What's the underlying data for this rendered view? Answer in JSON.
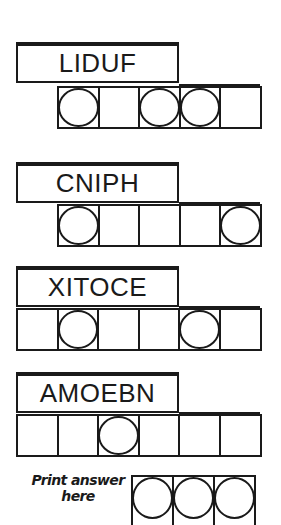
{
  "puzzles": [
    {
      "scrambled": "LIDUF",
      "cells": 5,
      "circled": [
        1,
        3,
        4
      ],
      "top": 42
    },
    {
      "scrambled": "CNIPH",
      "cells": 5,
      "circled": [
        1,
        5
      ],
      "top": 162
    },
    {
      "scrambled": "XITOCE",
      "cells": 6,
      "circled": [
        2,
        5
      ],
      "top": 266
    },
    {
      "scrambled": "AMOEBN",
      "cells": 6,
      "circled": [
        3
      ],
      "top": 372
    }
  ],
  "answer": {
    "label_line1": "Print answer",
    "label_line2": "here",
    "cells": 3,
    "circled": [
      1,
      2,
      3
    ]
  }
}
